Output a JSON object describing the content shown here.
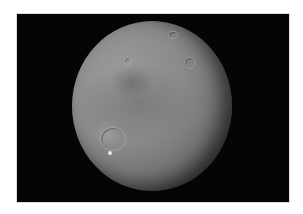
{
  "image": {
    "subject": "cratered moon",
    "background_color": "#050505",
    "frame_color": "#ffffff",
    "moon_tone": "#8a8a8a"
  }
}
